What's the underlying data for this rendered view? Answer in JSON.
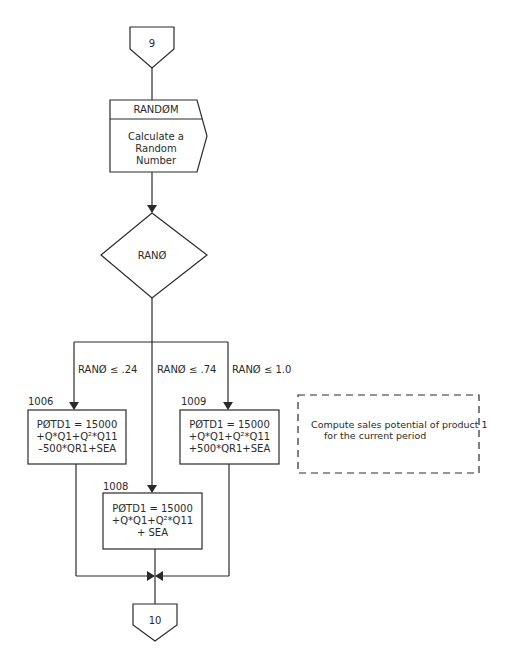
{
  "connectors": {
    "start": {
      "label": "9"
    },
    "end": {
      "label": "10"
    }
  },
  "subroutine": {
    "title": "RANDØM",
    "body": [
      "Calculate a",
      "Random",
      "Number"
    ]
  },
  "decision": {
    "label": "RANØ"
  },
  "branches": [
    {
      "condition": "RANØ ≤ .24"
    },
    {
      "condition": "RANØ ≤ .74"
    },
    {
      "condition": "RANØ ≤ 1.0"
    }
  ],
  "process_boxes": {
    "box_1006": {
      "id": "1006",
      "lines": [
        "PØTD1 = 15000",
        "+Q*Q1+Q²*Q11",
        "–500*QR1+SEA"
      ]
    },
    "box_1008": {
      "id": "1008",
      "lines": [
        "PØTD1 = 15000",
        "+Q*Q1+Q²*Q11",
        "+ SEA"
      ]
    },
    "box_1009": {
      "id": "1009",
      "lines": [
        "PØTD1 = 15000",
        "+Q*Q1+Q²*Q11",
        "+500*QR1+SEA"
      ]
    }
  },
  "annotation": {
    "lines": [
      "Compute sales potential of product 1",
      "for the current period"
    ]
  },
  "colors": {
    "stroke": "#2a2a2a",
    "background": "#ffffff"
  }
}
